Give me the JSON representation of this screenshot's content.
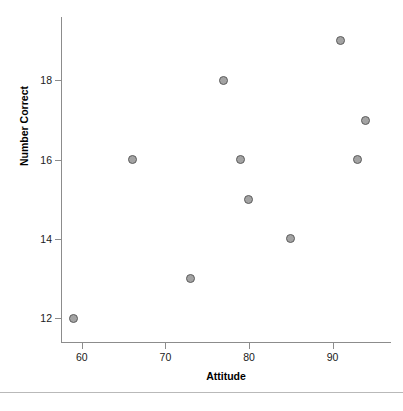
{
  "chart_data": {
    "type": "scatter",
    "title": "",
    "xlabel": "Attitude",
    "ylabel": "Number Correct",
    "xlim": [
      57.5,
      97
    ],
    "ylim": [
      11.4,
      19.6
    ],
    "xticks": [
      60,
      70,
      80,
      90
    ],
    "yticks": [
      12,
      14,
      16,
      18
    ],
    "grid": false,
    "legend": null,
    "marker": {
      "shape": "circle",
      "fill_color": "#a3a3a3",
      "edge_color": "#5c5c5c",
      "size_px": 9
    },
    "axis_color": "#8c8c8c",
    "points": [
      {
        "x": 59,
        "y": 12
      },
      {
        "x": 66,
        "y": 16
      },
      {
        "x": 73,
        "y": 13
      },
      {
        "x": 77,
        "y": 18
      },
      {
        "x": 79,
        "y": 16
      },
      {
        "x": 80,
        "y": 15
      },
      {
        "x": 85,
        "y": 14
      },
      {
        "x": 91,
        "y": 19
      },
      {
        "x": 93,
        "y": 16
      },
      {
        "x": 94,
        "y": 17
      }
    ]
  },
  "caption": {
    "text": ""
  }
}
